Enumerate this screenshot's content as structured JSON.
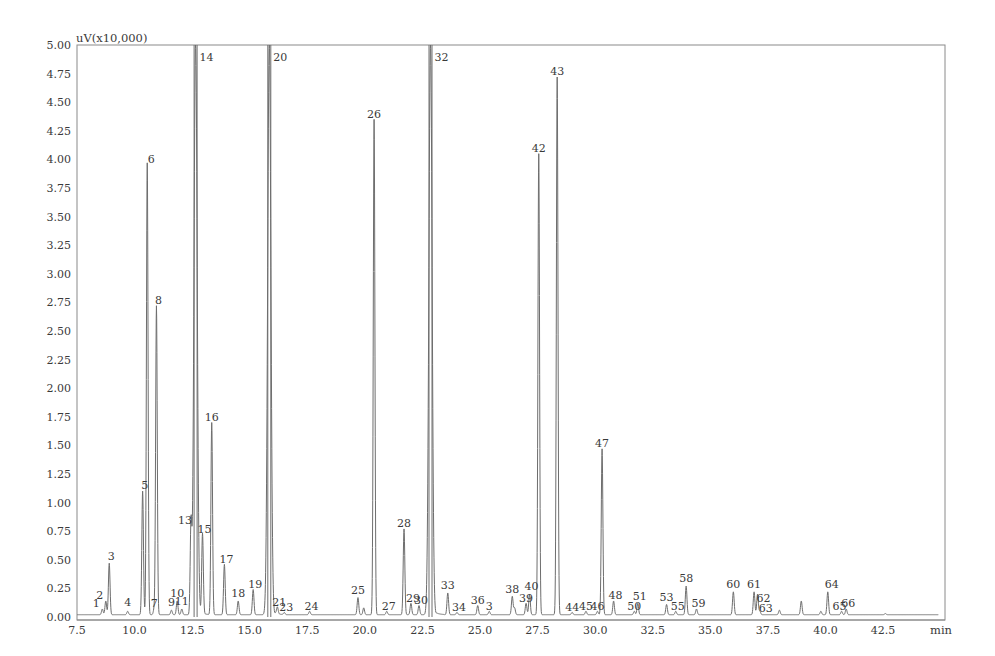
{
  "chart_data": {
    "type": "line",
    "title": "",
    "subtitle": "",
    "ylabel": "uV(x10,000)",
    "xlabel": "min",
    "xlim": [
      7.5,
      45.0
    ],
    "ylim": [
      0.0,
      5.0
    ],
    "grid": false,
    "legend": null,
    "x_ticks": [
      "7.5",
      "10.0",
      "12.5",
      "15.0",
      "17.5",
      "20.0",
      "22.5",
      "25.0",
      "27.5",
      "30.0",
      "32.5",
      "35.0",
      "37.5",
      "40.0",
      "42.5"
    ],
    "y_ticks": [
      "0.00",
      "0.25",
      "0.50",
      "0.75",
      "1.00",
      "1.25",
      "1.50",
      "1.75",
      "2.00",
      "2.25",
      "2.50",
      "2.75",
      "3.00",
      "3.25",
      "3.50",
      "3.75",
      "4.00",
      "4.25",
      "4.50",
      "4.75",
      "5.00"
    ],
    "peaks": [
      {
        "id": "1",
        "rt": 8.6,
        "height": 0.05,
        "label_dx": -6,
        "label_dy": -4
      },
      {
        "id": "2",
        "rt": 8.75,
        "height": 0.12,
        "label_dx": -6,
        "label_dy": -4
      },
      {
        "id": "3",
        "rt": 8.9,
        "height": 0.45,
        "label_dx": 2,
        "label_dy": -6
      },
      {
        "id": "4",
        "rt": 9.7,
        "height": 0.03,
        "label_dx": 0,
        "label_dy": -8
      },
      {
        "id": "5",
        "rt": 10.35,
        "height": 1.08,
        "label_dx": 2,
        "label_dy": -4
      },
      {
        "id": "6",
        "rt": 10.55,
        "height": 3.95,
        "label_dx": 4,
        "label_dy": -2
      },
      {
        "id": "7",
        "rt": 10.85,
        "height": 0.05,
        "label_dx": 0,
        "label_dy": -4
      },
      {
        "id": "8",
        "rt": 10.95,
        "height": 2.7,
        "label_dx": 2,
        "label_dy": -4
      },
      {
        "id": "9",
        "rt": 11.6,
        "height": 0.04,
        "label_dx": 0,
        "label_dy": -6
      },
      {
        "id": "10",
        "rt": 11.85,
        "height": 0.12,
        "label_dx": 0,
        "label_dy": -6
      },
      {
        "id": "11",
        "rt": 12.05,
        "height": 0.05,
        "label_dx": 0,
        "label_dy": -6
      },
      {
        "id": "13",
        "rt": 12.45,
        "height": 0.78,
        "label_dx": -6,
        "label_dy": -4
      },
      {
        "id": "14",
        "rt": 12.65,
        "height": 5.0,
        "label_dx": 4,
        "label_dy": -4
      },
      {
        "id": "15",
        "rt": 12.95,
        "height": 0.7,
        "label_dx": 2,
        "label_dy": -4
      },
      {
        "id": "16",
        "rt": 13.35,
        "height": 1.68,
        "label_dx": 0,
        "label_dy": -4
      },
      {
        "id": "17",
        "rt": 13.9,
        "height": 0.44,
        "label_dx": 2,
        "label_dy": -4
      },
      {
        "id": "18",
        "rt": 14.5,
        "height": 0.12,
        "label_dx": 0,
        "label_dy": -6
      },
      {
        "id": "19",
        "rt": 15.15,
        "height": 0.22,
        "label_dx": 2,
        "label_dy": -4
      },
      {
        "id": "20",
        "rt": 15.85,
        "height": 5.0,
        "label_dx": 4,
        "label_dy": -4
      },
      {
        "id": "21",
        "rt": 16.2,
        "height": 0.06,
        "label_dx": 2,
        "label_dy": -4
      },
      {
        "id": "23",
        "rt": 16.5,
        "height": 0.02,
        "label_dx": 2,
        "label_dy": -4
      },
      {
        "id": "24",
        "rt": 17.6,
        "height": 0.03,
        "label_dx": 2,
        "label_dy": -4
      },
      {
        "id": "25",
        "rt": 19.7,
        "height": 0.15,
        "label_dx": 0,
        "label_dy": -6
      },
      {
        "id": "26",
        "rt": 20.4,
        "height": 4.33,
        "label_dx": 0,
        "label_dy": -4
      },
      {
        "id": "27",
        "rt": 20.95,
        "height": 0.03,
        "label_dx": 2,
        "label_dy": -4
      },
      {
        "id": "28",
        "rt": 21.7,
        "height": 0.75,
        "label_dx": 0,
        "label_dy": -4
      },
      {
        "id": "29",
        "rt": 22.0,
        "height": 0.1,
        "label_dx": 2,
        "label_dy": -4
      },
      {
        "id": "30",
        "rt": 22.35,
        "height": 0.08,
        "label_dx": 2,
        "label_dy": -4
      },
      {
        "id": "32",
        "rt": 22.85,
        "height": 5.0,
        "label_dx": 4,
        "label_dy": -4
      },
      {
        "id": "33",
        "rt": 23.6,
        "height": 0.19,
        "label_dx": 0,
        "label_dy": -6
      },
      {
        "id": "34",
        "rt": 24.0,
        "height": 0.02,
        "label_dx": 2,
        "label_dy": -4
      },
      {
        "id": "36",
        "rt": 24.9,
        "height": 0.08,
        "label_dx": 0,
        "label_dy": -4
      },
      {
        "id": "3",
        "rt": 25.4,
        "height": 0.03,
        "label_dx": 0,
        "label_dy": -4
      },
      {
        "id": "38",
        "rt": 26.4,
        "height": 0.16,
        "label_dx": 0,
        "label_dy": -6
      },
      {
        "id": "39",
        "rt": 27.0,
        "height": 0.1,
        "label_dx": 0,
        "label_dy": -4
      },
      {
        "id": "40",
        "rt": 27.15,
        "height": 0.18,
        "label_dx": 2,
        "label_dy": -6
      },
      {
        "id": "42",
        "rt": 27.55,
        "height": 4.03,
        "label_dx": 0,
        "label_dy": -4
      },
      {
        "id": "43",
        "rt": 28.35,
        "height": 4.7,
        "label_dx": 0,
        "label_dy": -4
      },
      {
        "id": "44",
        "rt": 29.0,
        "height": 0.02,
        "label_dx": 0,
        "label_dy": -4
      },
      {
        "id": "45",
        "rt": 29.6,
        "height": 0.03,
        "label_dx": 0,
        "label_dy": -4
      },
      {
        "id": "46",
        "rt": 30.1,
        "height": 0.03,
        "label_dx": 0,
        "label_dy": -4
      },
      {
        "id": "47",
        "rt": 30.3,
        "height": 1.45,
        "label_dx": 0,
        "label_dy": -4
      },
      {
        "id": "48",
        "rt": 30.8,
        "height": 0.12,
        "label_dx": 2,
        "label_dy": -4
      },
      {
        "id": "50",
        "rt": 31.7,
        "height": 0.03,
        "label_dx": 0,
        "label_dy": -4
      },
      {
        "id": "51",
        "rt": 31.85,
        "height": 0.1,
        "label_dx": 2,
        "label_dy": -6
      },
      {
        "id": "53",
        "rt": 33.1,
        "height": 0.09,
        "label_dx": 0,
        "label_dy": -6
      },
      {
        "id": "55",
        "rt": 33.5,
        "height": 0.03,
        "label_dx": 2,
        "label_dy": -4
      },
      {
        "id": "58",
        "rt": 33.95,
        "height": 0.25,
        "label_dx": 0,
        "label_dy": -6
      },
      {
        "id": "59",
        "rt": 34.4,
        "height": 0.05,
        "label_dx": 2,
        "label_dy": -4
      },
      {
        "id": "60",
        "rt": 36.0,
        "height": 0.2,
        "label_dx": 0,
        "label_dy": -6
      },
      {
        "id": "61",
        "rt": 36.9,
        "height": 0.2,
        "label_dx": 0,
        "label_dy": -6
      },
      {
        "id": "62",
        "rt": 37.05,
        "height": 0.18,
        "label_dx": 6,
        "label_dy": 6
      },
      {
        "id": "63",
        "rt": 37.15,
        "height": 0.03,
        "label_dx": 6,
        "label_dy": -2
      },
      {
        "id": "64",
        "rt": 40.1,
        "height": 0.2,
        "label_dx": 4,
        "label_dy": -6
      },
      {
        "id": "65",
        "rt": 40.7,
        "height": 0.03,
        "label_dx": -2,
        "label_dy": -4
      },
      {
        "id": "66",
        "rt": 40.9,
        "height": 0.05,
        "label_dx": 2,
        "label_dy": -4
      }
    ],
    "unlabeled_peaks": [
      {
        "rt": 19.95,
        "height": 0.06
      },
      {
        "rt": 26.5,
        "height": 0.06
      },
      {
        "rt": 38.0,
        "height": 0.04
      },
      {
        "rt": 38.95,
        "height": 0.12
      },
      {
        "rt": 39.8,
        "height": 0.03
      },
      {
        "rt": 42.6,
        "height": 0.01
      }
    ]
  }
}
